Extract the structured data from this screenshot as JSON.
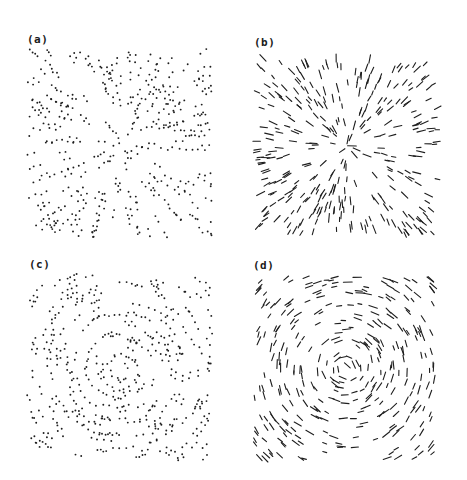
{
  "figure": {
    "background": "#ffffff",
    "ink_color": "#1e1e1e",
    "panels": [
      {
        "id": "a",
        "label": "(a)",
        "label_pos": [
          27,
          33
        ],
        "box": [
          25,
          48,
          190,
          190
        ],
        "field": "radial",
        "glyph": "dot-pairs",
        "description": "random-dot pattern, pairs aligned radially (expansion)"
      },
      {
        "id": "b",
        "label": "(b)",
        "label_pos": [
          254,
          36
        ],
        "box": [
          252,
          52,
          190,
          188
        ],
        "field": "radial",
        "glyph": "line-segments",
        "description": "short line segments aligned radially from center"
      },
      {
        "id": "c",
        "label": "(c)",
        "label_pos": [
          29,
          258
        ],
        "box": [
          25,
          272,
          190,
          190
        ],
        "field": "concentric",
        "glyph": "dot-pairs",
        "description": "random-dot pattern, pairs aligned along concentric circles (rotation)"
      },
      {
        "id": "d",
        "label": "(d)",
        "label_pos": [
          253,
          259
        ],
        "box": [
          250,
          273,
          190,
          190
        ],
        "field": "concentric",
        "glyph": "line-segments",
        "description": "short line segments aligned tangentially around center"
      }
    ]
  }
}
